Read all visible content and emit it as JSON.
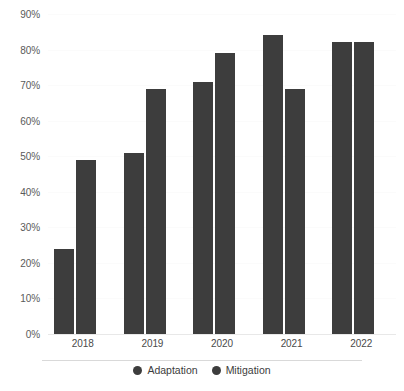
{
  "chart_data": {
    "type": "bar",
    "title": "",
    "subtitle": "",
    "xlabel": "",
    "ylabel": "",
    "categories": [
      "2018",
      "2019",
      "2020",
      "2021",
      "2022"
    ],
    "series": [
      {
        "name": "Adaptation",
        "color": "#3d3d3d",
        "values": [
          24,
          51,
          71,
          84,
          82
        ]
      },
      {
        "name": "Mitigation",
        "color": "#3d3d3d",
        "values": [
          49,
          69,
          79,
          69,
          82
        ]
      }
    ],
    "ylim": [
      0,
      90
    ],
    "ytick_step": 10,
    "ytick_labels": [
      "0%",
      "10%",
      "20%",
      "30%",
      "40%",
      "50%",
      "60%",
      "70%",
      "80%",
      "90%"
    ],
    "value_suffix": "%",
    "grid": true,
    "grid_color": "#fbfbfb",
    "axis_line_color": "#e8e8e8",
    "legend_position": "bottom",
    "legend_marker": "circle",
    "background": "#ffffff"
  },
  "legend": {
    "items": [
      {
        "label": "Adaptation",
        "color": "#3d3d3d"
      },
      {
        "label": "Mitigation",
        "color": "#3d3d3d"
      }
    ]
  }
}
